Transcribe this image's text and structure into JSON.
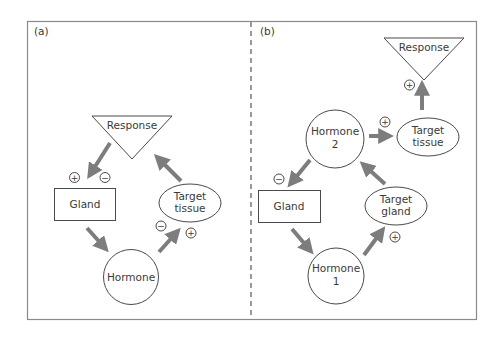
{
  "figure": {
    "frame_color": "#8a8a8a",
    "arrow_color": "#7d7d7d",
    "divider_style": "dashed"
  },
  "panel_a": {
    "label": "(a)",
    "nodes": {
      "response": "Response",
      "gland": "Gland",
      "hormone": "Hormone",
      "target_line1": "Target",
      "target_line2": "tissue"
    },
    "signs": {
      "response_to_gland_plus": "+",
      "response_to_gland_minus": "−",
      "hormone_to_target_minus": "−",
      "hormone_to_target_plus": "+"
    },
    "edges": [
      {
        "from": "Response",
        "to": "Gland",
        "effect": "+/−"
      },
      {
        "from": "Gland",
        "to": "Hormone",
        "effect": ""
      },
      {
        "from": "Hormone",
        "to": "Target tissue",
        "effect": "−/+"
      },
      {
        "from": "Target tissue",
        "to": "Response",
        "effect": ""
      }
    ]
  },
  "panel_b": {
    "label": "(b)",
    "nodes": {
      "response": "Response",
      "hormone2_line1": "Hormone",
      "hormone2_line2": "2",
      "target_tissue_line1": "Target",
      "target_tissue_line2": "tissue",
      "gland": "Gland",
      "target_gland_line1": "Target",
      "target_gland_line2": "gland",
      "hormone1_line1": "Hormone",
      "hormone1_line2": "1"
    },
    "signs": {
      "tissue_to_response_plus": "+",
      "hormone2_to_tissue_plus": "+",
      "hormone2_to_gland_minus": "−",
      "hormone1_to_target_gland_plus": "+"
    },
    "edges": [
      {
        "from": "Gland",
        "to": "Hormone 1",
        "effect": ""
      },
      {
        "from": "Hormone 1",
        "to": "Target gland",
        "effect": "+"
      },
      {
        "from": "Target gland",
        "to": "Hormone 2",
        "effect": ""
      },
      {
        "from": "Hormone 2",
        "to": "Gland",
        "effect": "−"
      },
      {
        "from": "Hormone 2",
        "to": "Target tissue",
        "effect": "+"
      },
      {
        "from": "Target tissue",
        "to": "Response",
        "effect": "+"
      }
    ]
  }
}
